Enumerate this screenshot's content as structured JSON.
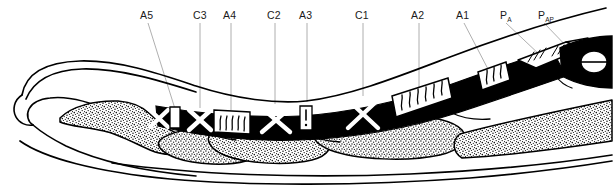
{
  "figure": {
    "background_color": "#ffffff",
    "ink_color": "#000000",
    "leader_color": "#9a9a9a",
    "width": 614,
    "height": 191
  },
  "labels": [
    {
      "id": "A5",
      "text": "A5",
      "sub": "",
      "x": 140,
      "y": 9,
      "leader": {
        "x1": 148,
        "y1": 23,
        "x2": 176,
        "y2": 112
      }
    },
    {
      "id": "C3",
      "text": "C3",
      "sub": "",
      "x": 193,
      "y": 9,
      "leader": {
        "x1": 200,
        "y1": 23,
        "x2": 200,
        "y2": 108
      }
    },
    {
      "id": "A4",
      "text": "A4",
      "sub": "",
      "x": 223,
      "y": 9,
      "leader": {
        "x1": 231,
        "y1": 23,
        "x2": 231,
        "y2": 110
      }
    },
    {
      "id": "C2",
      "text": "C2",
      "sub": "",
      "x": 267,
      "y": 9,
      "leader": {
        "x1": 275,
        "y1": 23,
        "x2": 275,
        "y2": 104
      }
    },
    {
      "id": "A3",
      "text": "A3",
      "sub": "",
      "x": 299,
      "y": 9,
      "leader": {
        "x1": 307,
        "y1": 23,
        "x2": 307,
        "y2": 102
      }
    },
    {
      "id": "C1",
      "text": "C1",
      "sub": "",
      "x": 355,
      "y": 9,
      "leader": {
        "x1": 363,
        "y1": 23,
        "x2": 363,
        "y2": 96
      }
    },
    {
      "id": "A2",
      "text": "A2",
      "sub": "",
      "x": 411,
      "y": 9,
      "leader": {
        "x1": 419,
        "y1": 23,
        "x2": 419,
        "y2": 90
      }
    },
    {
      "id": "A1",
      "text": "A1",
      "sub": "",
      "x": 456,
      "y": 9,
      "leader": {
        "x1": 464,
        "y1": 23,
        "x2": 489,
        "y2": 71
      }
    },
    {
      "id": "PA",
      "text": "P",
      "sub": "A",
      "x": 500,
      "y": 9,
      "leader": {
        "x1": 506,
        "y1": 23,
        "x2": 541,
        "y2": 56
      }
    },
    {
      "id": "PAP",
      "text": "P",
      "sub": "AP",
      "x": 538,
      "y": 9,
      "leader": {
        "x1": 544,
        "y1": 23,
        "x2": 570,
        "y2": 52
      }
    }
  ],
  "legend_semantics": {
    "annular_pulleys": [
      "A1",
      "A2",
      "A3",
      "A4",
      "A5"
    ],
    "cruciate_pulleys": [
      "C1",
      "C2",
      "C3"
    ],
    "palmar_aponeurosis_pulleys": [
      "P A",
      "P AP"
    ],
    "annular_style": "white band with vertical wavy hatching",
    "cruciate_style": "solid black band with white X (cross) shape",
    "bone_style": "stippled (dotted) phalanges",
    "outline_style": "black ink contour line"
  }
}
